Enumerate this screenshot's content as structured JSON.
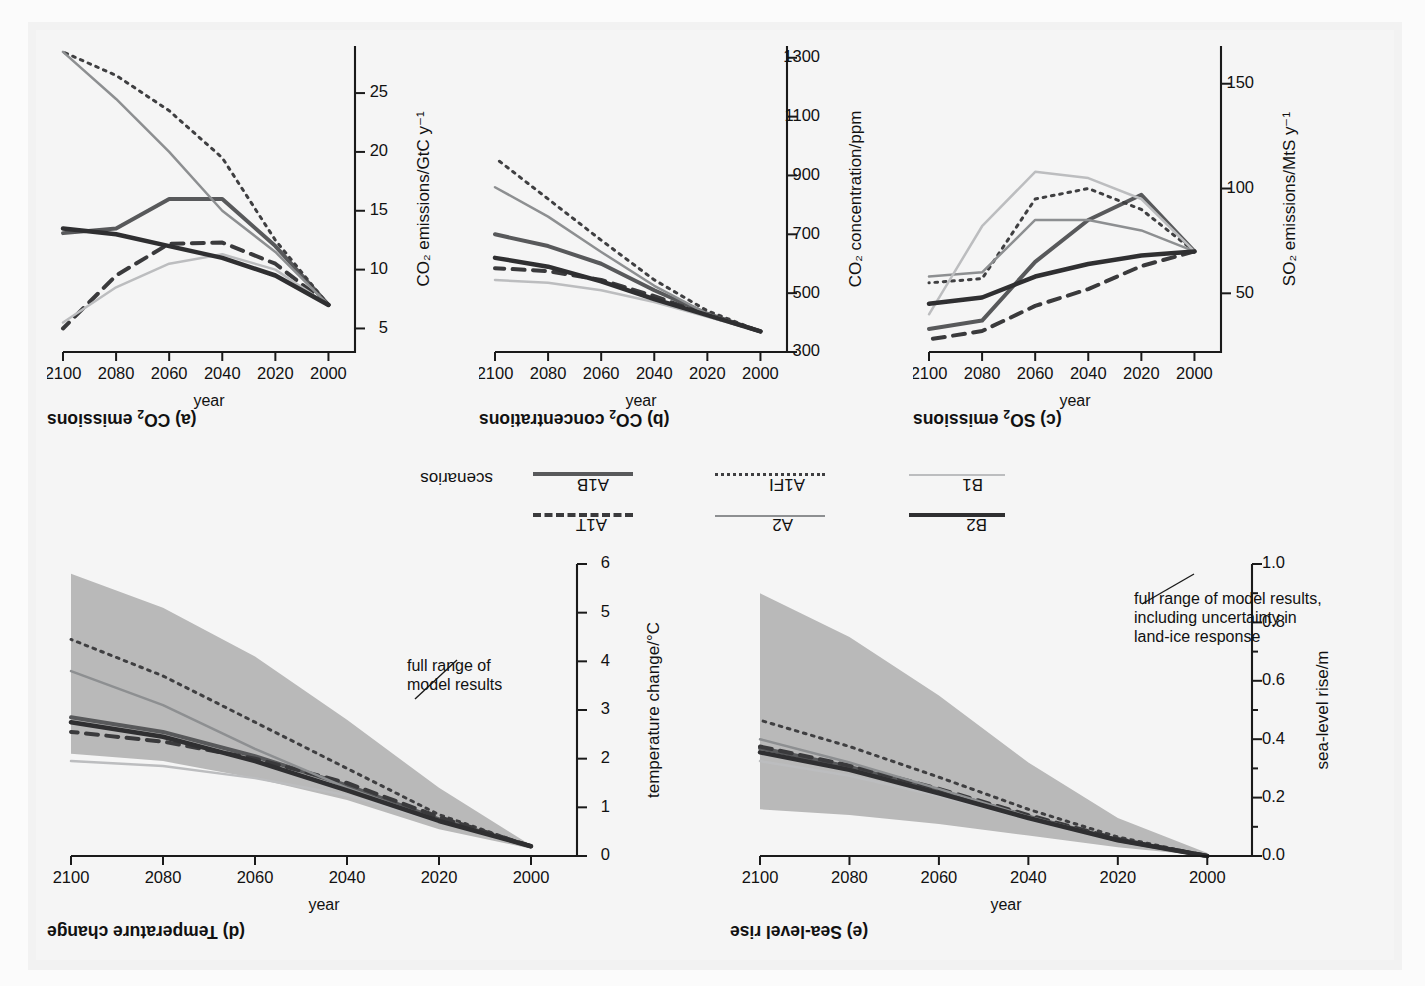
{
  "figure": {
    "legend_group_label": "scenarios",
    "legend": [
      {
        "name": "A1B",
        "style": "solid",
        "color": "#58595b",
        "width": 4.0
      },
      {
        "name": "A1FI",
        "style": "dotted",
        "color": "#3f3f41",
        "width": 3.0
      },
      {
        "name": "A1T",
        "style": "dashed",
        "color": "#3a3a3c",
        "width": 4.0
      },
      {
        "name": "A2",
        "style": "solid",
        "color": "#8d8f91",
        "width": 2.5
      },
      {
        "name": "B1",
        "style": "solid",
        "color": "#bcbdbf",
        "width": 2.5
      },
      {
        "name": "B2",
        "style": "solid",
        "color": "#2f2f31",
        "width": 4.5
      }
    ]
  },
  "chart_data": [
    {
      "id": "a",
      "type": "line",
      "title": "(a) CO₂ emissions",
      "xlabel": "year",
      "ylabel": "CO₂ emissions/GtC y⁻¹",
      "xticks": [
        2000,
        2020,
        2040,
        2060,
        2080,
        2100
      ],
      "yticks": [
        5,
        10,
        15,
        20,
        25
      ],
      "xlim": [
        1990,
        2100
      ],
      "ylim": [
        3,
        29
      ],
      "grid": false,
      "legend_position": "external-center",
      "x": [
        2000,
        2020,
        2040,
        2060,
        2080,
        2100
      ],
      "series": [
        {
          "name": "A1B",
          "values": [
            7.0,
            12.0,
            16.0,
            16.0,
            13.5,
            13.1
          ]
        },
        {
          "name": "A1FI",
          "values": [
            7.0,
            12.5,
            19.5,
            23.5,
            26.5,
            28.5
          ]
        },
        {
          "name": "A1T",
          "values": [
            7.0,
            10.5,
            12.3,
            12.2,
            9.5,
            5.0
          ]
        },
        {
          "name": "A2",
          "values": [
            7.0,
            11.5,
            15.0,
            20.0,
            24.5,
            28.5
          ]
        },
        {
          "name": "B1",
          "values": [
            7.0,
            10.0,
            11.3,
            10.5,
            8.5,
            5.5
          ]
        },
        {
          "name": "B2",
          "values": [
            7.0,
            9.5,
            11.0,
            12.0,
            13.0,
            13.5
          ]
        }
      ]
    },
    {
      "id": "b",
      "type": "line",
      "title": "(b) CO₂ concentrations",
      "xlabel": "year",
      "ylabel": "CO₂ concentration/ppm",
      "xticks": [
        2000,
        2020,
        2040,
        2060,
        2080,
        2100
      ],
      "yticks": [
        300,
        500,
        700,
        900,
        1100,
        1300
      ],
      "xlim": [
        1990,
        2100
      ],
      "ylim": [
        300,
        1340
      ],
      "grid": false,
      "x": [
        2000,
        2020,
        2040,
        2060,
        2080,
        2100
      ],
      "series": [
        {
          "name": "A1B",
          "values": [
            370,
            430,
            510,
            600,
            660,
            700
          ]
        },
        {
          "name": "A1FI",
          "values": [
            370,
            440,
            545,
            680,
            820,
            960
          ]
        },
        {
          "name": "A1T",
          "values": [
            370,
            425,
            490,
            545,
            575,
            585
          ]
        },
        {
          "name": "A2",
          "values": [
            370,
            430,
            525,
            640,
            760,
            860
          ]
        },
        {
          "name": "B1",
          "values": [
            370,
            420,
            470,
            510,
            535,
            545
          ]
        },
        {
          "name": "B2",
          "values": [
            370,
            425,
            480,
            540,
            590,
            620
          ]
        }
      ]
    },
    {
      "id": "c",
      "type": "line",
      "title": "(c) SO₂ emissions",
      "xlabel": "year",
      "ylabel": "SO₂ emissions/MtS y⁻¹",
      "xticks": [
        2000,
        2020,
        2040,
        2060,
        2080,
        2100
      ],
      "yticks": [
        50,
        100,
        150
      ],
      "xlim": [
        1990,
        2100
      ],
      "ylim": [
        22,
        168
      ],
      "grid": false,
      "x": [
        2000,
        2020,
        2040,
        2060,
        2080,
        2100
      ],
      "series": [
        {
          "name": "A1B",
          "values": [
            70,
            97,
            85,
            65,
            37,
            33
          ]
        },
        {
          "name": "A1FI",
          "values": [
            70,
            90,
            100,
            95,
            57,
            55
          ]
        },
        {
          "name": "A1T",
          "values": [
            70,
            63,
            52,
            44,
            32,
            28
          ]
        },
        {
          "name": "A2",
          "values": [
            70,
            80,
            85,
            85,
            60,
            58
          ]
        },
        {
          "name": "B1",
          "values": [
            70,
            95,
            105,
            108,
            82,
            40
          ]
        },
        {
          "name": "B2",
          "values": [
            70,
            68,
            64,
            58,
            48,
            45
          ]
        }
      ]
    },
    {
      "id": "d",
      "type": "line",
      "title": "(d) Temperature change",
      "xlabel": "year",
      "ylabel": "temperature change/°C",
      "xticks": [
        2000,
        2020,
        2040,
        2060,
        2080,
        2100
      ],
      "yticks": [
        0,
        1,
        2,
        3,
        4,
        5,
        6
      ],
      "xlim": [
        1990,
        2100
      ],
      "ylim": [
        0,
        6
      ],
      "grid": false,
      "annotation": "full range of\nmodel results",
      "band": {
        "name": "full range of model results",
        "color": "#b9b9b9",
        "x": [
          2000,
          2020,
          2040,
          2060,
          2080,
          2100
        ],
        "upper": [
          0.15,
          0.55,
          1.15,
          1.6,
          1.95,
          2.1
        ],
        "lower": [
          0.22,
          1.4,
          2.8,
          4.1,
          5.1,
          5.8
        ]
      },
      "x": [
        2000,
        2020,
        2040,
        2060,
        2080,
        2100
      ],
      "series": [
        {
          "name": "A1B",
          "values": [
            0.2,
            0.75,
            1.45,
            2.05,
            2.55,
            2.85
          ]
        },
        {
          "name": "A1FI",
          "values": [
            0.2,
            0.85,
            1.8,
            2.75,
            3.7,
            4.45
          ]
        },
        {
          "name": "A1T",
          "values": [
            0.2,
            0.8,
            1.5,
            2.0,
            2.35,
            2.55
          ]
        },
        {
          "name": "A2",
          "values": [
            0.2,
            0.72,
            1.4,
            2.2,
            3.1,
            3.8
          ]
        },
        {
          "name": "B1",
          "values": [
            0.2,
            0.7,
            1.25,
            1.6,
            1.85,
            1.95
          ]
        },
        {
          "name": "B2",
          "values": [
            0.2,
            0.72,
            1.35,
            1.95,
            2.45,
            2.75
          ]
        }
      ]
    },
    {
      "id": "e",
      "type": "line",
      "title": "(e) Sea-level rise",
      "xlabel": "year",
      "ylabel": "sea-level rise/m",
      "xticks": [
        2000,
        2020,
        2040,
        2060,
        2080,
        2100
      ],
      "yticks": [
        "0.0",
        "0.2",
        "0.4",
        "0.6",
        "0.8",
        "1.0"
      ],
      "xlim": [
        1990,
        2100
      ],
      "ylim": [
        0.0,
        1.0
      ],
      "grid": false,
      "annotation": "full range of model results,\nincluding uncertainty in\nland-ice response",
      "band": {
        "name": "full range of model results, including uncertainty in land-ice response",
        "color": "#b9b9b9",
        "x": [
          2000,
          2020,
          2040,
          2060,
          2080,
          2100
        ],
        "upper": [
          0.0,
          0.03,
          0.07,
          0.11,
          0.14,
          0.16
        ],
        "lower": [
          0.01,
          0.13,
          0.32,
          0.55,
          0.75,
          0.9
        ]
      },
      "x": [
        2000,
        2020,
        2040,
        2060,
        2080,
        2100
      ],
      "series": [
        {
          "name": "A1B",
          "values": [
            0.0,
            0.055,
            0.135,
            0.225,
            0.305,
            0.37
          ]
        },
        {
          "name": "A1FI",
          "values": [
            0.0,
            0.065,
            0.16,
            0.27,
            0.375,
            0.465
          ]
        },
        {
          "name": "A1T",
          "values": [
            0.0,
            0.058,
            0.14,
            0.23,
            0.31,
            0.375
          ]
        },
        {
          "name": "A2",
          "values": [
            0.0,
            0.055,
            0.135,
            0.23,
            0.32,
            0.4
          ]
        },
        {
          "name": "B1",
          "values": [
            0.0,
            0.052,
            0.125,
            0.205,
            0.275,
            0.325
          ]
        },
        {
          "name": "B2",
          "values": [
            0.0,
            0.054,
            0.13,
            0.215,
            0.295,
            0.355
          ]
        }
      ]
    }
  ]
}
